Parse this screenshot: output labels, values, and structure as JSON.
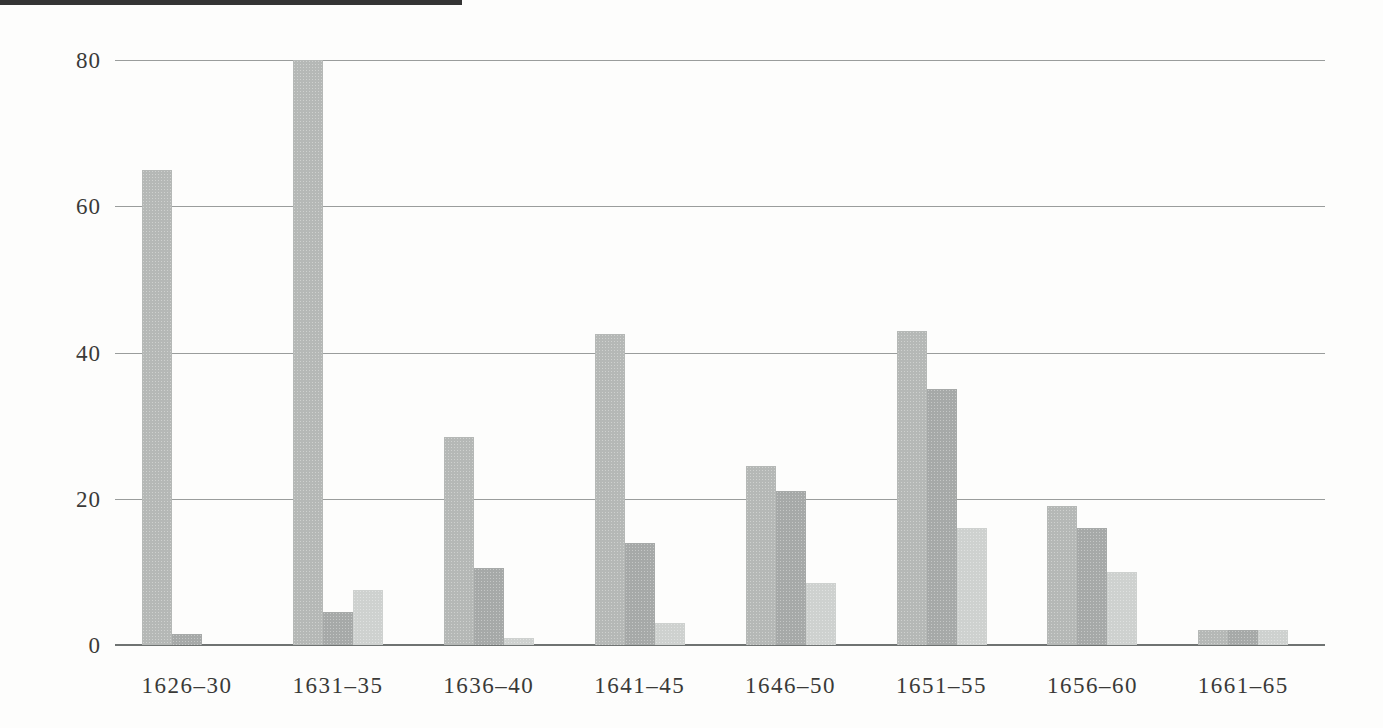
{
  "page": {
    "background_color": "#fdfdfc",
    "scan_artifact_color": "#343434"
  },
  "chart_data": {
    "type": "bar",
    "title": "",
    "xlabel": "",
    "ylabel": "",
    "categories": [
      "1626–30",
      "1631–35",
      "1636–40",
      "1641–45",
      "1646–50",
      "1651–55",
      "1656–60",
      "1661–65"
    ],
    "series": [
      {
        "name": "series-1-medium-gray",
        "color": "#b5b8b6",
        "values": [
          65,
          80,
          28.5,
          42.5,
          24.5,
          43,
          19,
          2
        ]
      },
      {
        "name": "series-2-dark-gray",
        "color": "#a6a9a8",
        "values": [
          1.5,
          4.5,
          10.5,
          14,
          21,
          35,
          16,
          2
        ]
      },
      {
        "name": "series-3-light-gray",
        "color": "#ced1cf",
        "values": [
          0,
          7.5,
          1,
          3,
          8.5,
          16,
          10,
          2
        ]
      }
    ],
    "ylim": [
      0,
      80
    ],
    "yticks": [
      0,
      20,
      40,
      60,
      80
    ],
    "ytick_labels": [
      "0",
      "20",
      "40",
      "60",
      "80"
    ],
    "grid": true,
    "legend": "none",
    "gridline_color": "#9a9d9c",
    "baseline_color": "#6f7372",
    "text_color": "#3a3a38"
  }
}
